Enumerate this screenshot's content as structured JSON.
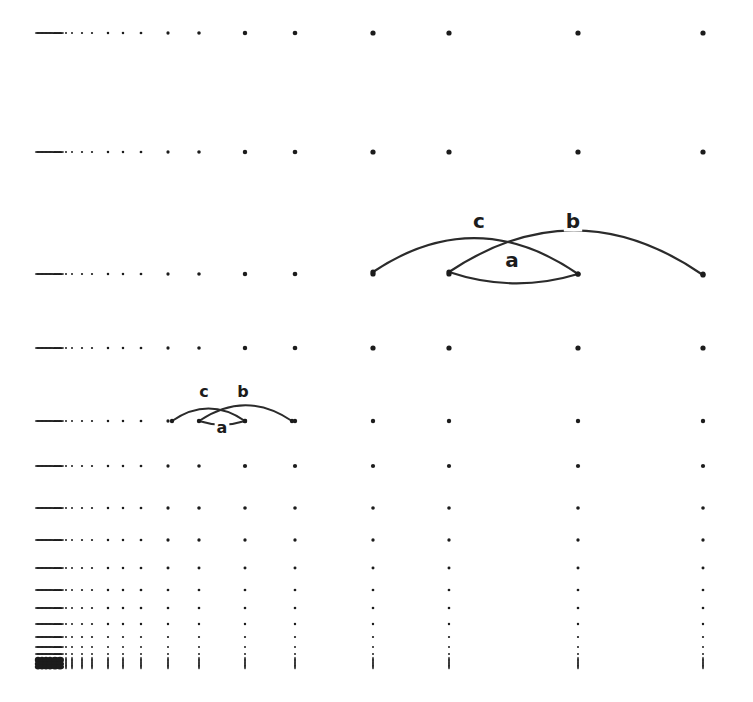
{
  "figure": {
    "background_color": "#ffffff",
    "ink_color": "#1c1c1c",
    "stroke_color": "#2b2b2b",
    "width": 753,
    "height": 702
  },
  "chart_data": {
    "type": "scatter",
    "subtitle": "",
    "xlabel": "",
    "ylabel": "",
    "grid": true,
    "legend": "none",
    "axis_scale_x": "log",
    "axis_scale_y": "log",
    "xlim": [
      38,
      745
    ],
    "ylim": [
      33,
      668
    ],
    "column_x": [
      38,
      42,
      46,
      50,
      55,
      60,
      66,
      72,
      82,
      92,
      108,
      123,
      141,
      168,
      199,
      245,
      295,
      373,
      449,
      578,
      703
    ],
    "row_y": [
      33,
      152,
      274,
      348,
      421,
      466,
      508,
      540,
      568,
      590,
      608,
      624,
      637,
      647,
      654,
      660,
      664,
      667
    ],
    "dot_radius_min": 0.9,
    "dot_radius_max": 2.6,
    "series": [
      {
        "name": "grid-dots",
        "marker": "filled-circle",
        "color": "#1c1c1c"
      }
    ],
    "annotations": [
      {
        "name": "small-diagram",
        "scale": "small",
        "nodes": [
          {
            "id": "p1",
            "x": 172,
            "y": 421
          },
          {
            "id": "p2",
            "x": 199,
            "y": 421
          },
          {
            "id": "p3",
            "x": 245,
            "y": 421
          },
          {
            "id": "p4",
            "x": 292,
            "y": 421
          }
        ],
        "arcs": [
          {
            "label": "a",
            "from": "p2",
            "to": "p3",
            "bulge": "down",
            "label_x": 222,
            "label_y": 428
          },
          {
            "label": "b",
            "from": "p2",
            "to": "p4",
            "bulge": "up",
            "label_x": 243,
            "label_y": 392
          },
          {
            "label": "c",
            "from": "p1",
            "to": "p3",
            "bulge": "up",
            "label_x": 204,
            "label_y": 392
          }
        ]
      },
      {
        "name": "large-diagram",
        "scale": "large",
        "nodes": [
          {
            "id": "q1",
            "x": 373,
            "y": 272
          },
          {
            "id": "q2",
            "x": 449,
            "y": 272
          },
          {
            "id": "q3",
            "x": 578,
            "y": 274
          },
          {
            "id": "q4",
            "x": 703,
            "y": 275
          }
        ],
        "arcs": [
          {
            "label": "a",
            "from": "q2",
            "to": "q3",
            "bulge": "down",
            "label_x": 512,
            "label_y": 261
          },
          {
            "label": "b",
            "from": "q2",
            "to": "q4",
            "bulge": "up",
            "label_x": 573,
            "label_y": 222
          },
          {
            "label": "c",
            "from": "q1",
            "to": "q3",
            "bulge": "up",
            "label_x": 479,
            "label_y": 222
          }
        ]
      }
    ]
  },
  "labels": {
    "a": "a",
    "b": "b",
    "c": "c"
  }
}
